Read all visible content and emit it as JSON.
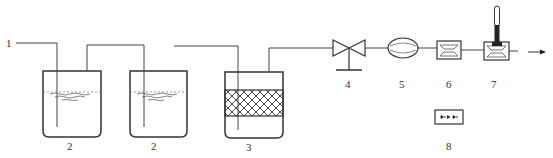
{
  "diagram": {
    "type": "process-flow",
    "colors": {
      "line": "#444444",
      "background": "#ffffff",
      "thermometer_fill": "#222222"
    },
    "labels": {
      "inlet": "1",
      "bottle_a": "2",
      "bottle_b": "2",
      "filter_bottle": "3",
      "valve": "4",
      "flow_meter": "5",
      "component_6": "6",
      "component_7": "7",
      "component_8": "8"
    },
    "components": [
      {
        "id": "1",
        "kind": "inlet-tube"
      },
      {
        "id": "2",
        "kind": "absorption-bottle-with-liquid"
      },
      {
        "id": "2",
        "kind": "absorption-bottle-with-liquid"
      },
      {
        "id": "3",
        "kind": "bottle-with-packed-mesh"
      },
      {
        "id": "4",
        "kind": "valve"
      },
      {
        "id": "5",
        "kind": "oval-meter"
      },
      {
        "id": "6",
        "kind": "rectangular-box"
      },
      {
        "id": "7",
        "kind": "box-with-thermometer"
      },
      {
        "id": "8",
        "kind": "box-with-dotted-arrow"
      }
    ],
    "flow_direction": "left-to-right"
  }
}
